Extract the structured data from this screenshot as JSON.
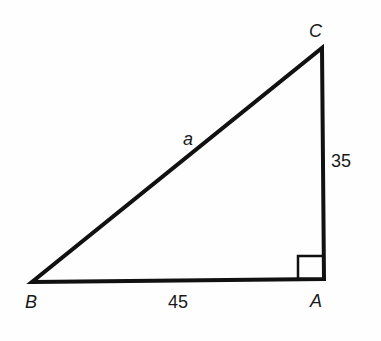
{
  "diagram": {
    "type": "right-triangle",
    "vertices": [
      {
        "label": "A",
        "x": 324,
        "y": 279,
        "note": "right angle"
      },
      {
        "label": "B",
        "x": 32,
        "y": 282
      },
      {
        "label": "C",
        "x": 322,
        "y": 48
      }
    ],
    "sides": {
      "hypotenuse_BC": {
        "label": "a"
      },
      "leg_BA": {
        "label": "45"
      },
      "leg_AC": {
        "label": "35"
      }
    },
    "right_angle_marker_at": "A",
    "colors": {
      "stroke": "#111111",
      "background": "#fefefe"
    }
  }
}
